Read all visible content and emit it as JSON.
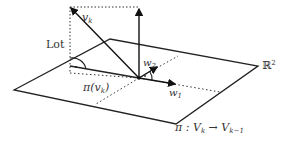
{
  "diagram": {
    "type": "vector-projection",
    "labels": {
      "vk": "v",
      "vk_sub": "k",
      "lot": "Lot",
      "pi_vk_pre": "π(v",
      "pi_vk_sub": "k",
      "pi_vk_post": ")",
      "w1": "w",
      "w1_sub": "1",
      "w2": "w",
      "w2_sub": "2",
      "plane": "ℝ",
      "plane_sup": "2",
      "map_pre": "π : V",
      "map_sub1": "k",
      "map_arrow": " → V",
      "map_sub2": "k−1"
    },
    "colors": {
      "line": "#222222",
      "text": "#333333",
      "background": "#ffffff"
    }
  }
}
